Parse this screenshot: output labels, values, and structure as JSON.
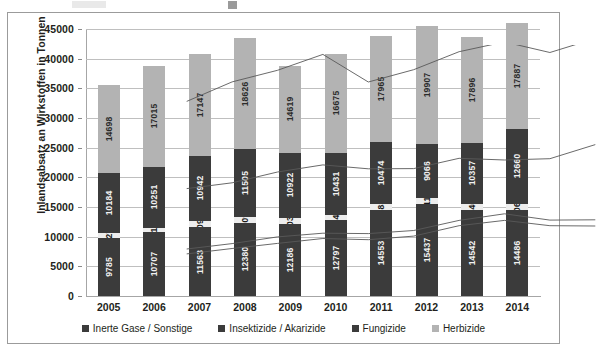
{
  "chart_data": {
    "type": "bar",
    "subtype": "stacked-column",
    "title": "",
    "xlabel": "",
    "ylabel": "Inlandsabsatz an Wirkstoffen in Tonnen",
    "categories": [
      "2005",
      "2006",
      "2007",
      "2008",
      "2009",
      "2010",
      "2011",
      "2012",
      "2013",
      "2014"
    ],
    "ylim": [
      0,
      45000
    ],
    "yticks": [
      0,
      5000,
      10000,
      15000,
      20000,
      25000,
      30000,
      35000,
      40000,
      45000
    ],
    "ytick_labels": [
      "0",
      "5000",
      "10000",
      "15000",
      "20000",
      "25000",
      "30000",
      "35000",
      "40000",
      "45000"
    ],
    "grid": true,
    "legend_position": "bottom",
    "series": [
      {
        "name": "Inerte Gase / Sonstige",
        "color": "#3b3b3b",
        "values": [
          9785,
          10707,
          11563,
          12380,
          12186,
          12797,
          14553,
          15437,
          14542,
          14486
        ]
      },
      {
        "name": "Insektizide / Akarizide",
        "color": "#ededed",
        "values": [
          827,
          813,
          1092,
          909,
          1030,
          941,
          883,
          1117,
          940,
          1061
        ]
      },
      {
        "name": "Fungizide",
        "color": "#3b3b3b",
        "values": [
          10184,
          10251,
          10942,
          11505,
          10922,
          10431,
          10474,
          9066,
          10357,
          12660
        ]
      },
      {
        "name": "Herbizide",
        "color": "#b3b3b3",
        "values": [
          14698,
          17015,
          17147,
          18626,
          14619,
          16675,
          17965,
          19907,
          17896,
          17887
        ]
      }
    ]
  },
  "legend": {
    "items": [
      {
        "label": "Inerte Gase / Sonstige",
        "color": "#3b3b3b"
      },
      {
        "label": "Insektizide / Akarizide",
        "color": "#3b3b3b"
      },
      {
        "label": "Fungizide",
        "color": "#3b3b3b"
      },
      {
        "label": "Herbizide",
        "color": "#b3b3b3"
      }
    ]
  }
}
